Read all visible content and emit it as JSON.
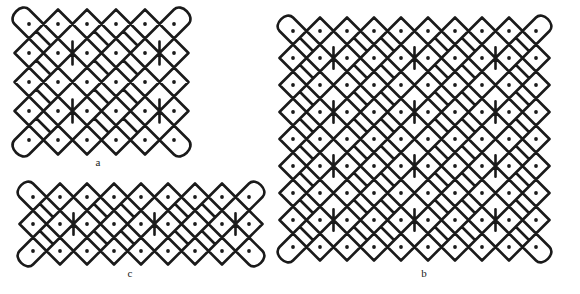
{
  "page": {
    "background_color": "#ffffff",
    "ink_color": "#1a1a1a",
    "width": 580,
    "height": 294,
    "kind": "line-drawing-figure-plate"
  },
  "figures": [
    {
      "id": "a",
      "label": "a",
      "name": "kolam-pattern-a",
      "grid_columns": 6,
      "grid_rows": 5,
      "cell_pitch": 29,
      "origin": {
        "x": 15,
        "y": 16
      },
      "label_position": {
        "x": 97,
        "y": 162
      },
      "stroke_width": 2.6,
      "dot_radius": 1.9,
      "description": "Square-ish lattice of 6 by 5 dots enclosed by interwoven looped curves; interior loops form leaf and heart motifs."
    },
    {
      "id": "b",
      "label": "b",
      "name": "kolam-pattern-b",
      "grid_columns": 10,
      "grid_rows": 9,
      "cell_pitch": 27,
      "origin": {
        "x": 17,
        "y": 17
      },
      "label_position": {
        "x": 423,
        "y": 273
      },
      "stroke_width": 2.6,
      "dot_radius": 1.9,
      "description": "Largest panel: 10 by 9 dot lattice woven with the same loop motif repeated across the whole field."
    },
    {
      "id": "c",
      "label": "c",
      "name": "kolam-pattern-c",
      "grid_columns": 9,
      "grid_rows": 3,
      "cell_pitch": 27,
      "origin": {
        "x": 15,
        "y": 16
      },
      "label_position": {
        "x": 129,
        "y": 273
      },
      "stroke_width": 2.6,
      "dot_radius": 1.9,
      "description": "Wide, short band of 9 by 3 dots; a single-row-high frieze version of the same woven loop pattern."
    }
  ],
  "labels": {
    "a": "a",
    "b": "b",
    "c": "c"
  }
}
